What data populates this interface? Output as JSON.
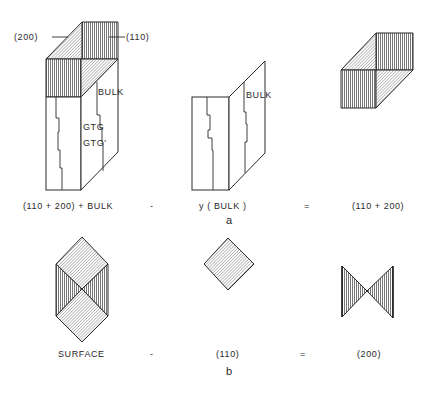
{
  "figure": {
    "panel_a": {
      "caption": "a",
      "left_block": {
        "callout_200": "(200)",
        "callout_110": "(110)",
        "label_bulk": "BULK",
        "label_gtg": "GTG",
        "label_gtg_prime": "GTG'"
      },
      "middle_block": {
        "label_bulk": "BULK"
      },
      "equation": {
        "term1": "(110 + 200) + BULK",
        "op1": "-",
        "term2": "y ( BULK )",
        "op2": "=",
        "result": "(110 + 200)"
      }
    },
    "panel_b": {
      "caption": "b",
      "equation": {
        "term1": "SURFACE",
        "op1": "-",
        "term2": "(110)",
        "op2": "=",
        "result": "(200)"
      }
    },
    "legend": {
      "vertical_hatch": "(110) face",
      "diagonal_hatch": "(200) face"
    }
  }
}
